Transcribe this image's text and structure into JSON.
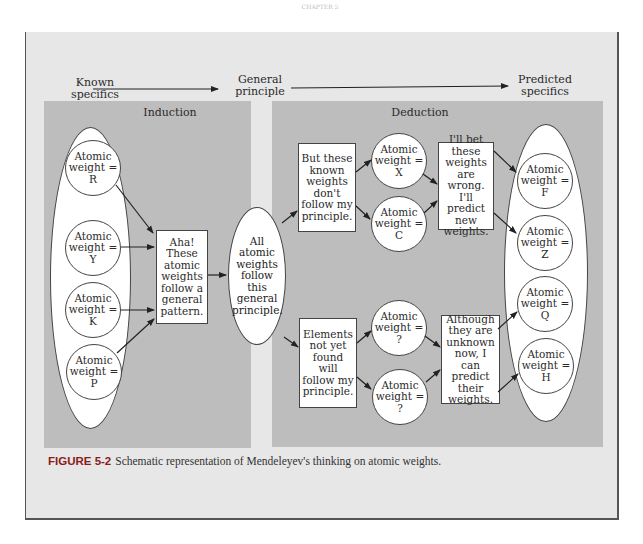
{
  "header": {
    "running_head": "CHAPTER 5"
  },
  "flow_labels": {
    "known_specifics": [
      "Known",
      "specifics"
    ],
    "general_principle": [
      "General",
      "principle"
    ],
    "predicted_specifics": [
      "Predicted",
      "specifics"
    ]
  },
  "panels": {
    "induction": {
      "title": "Induction"
    },
    "deduction": {
      "title": "Deduction"
    }
  },
  "induction": {
    "known_weights": [
      {
        "line1": "Atomic",
        "line2": "weight =",
        "value": "R"
      },
      {
        "line1": "Atomic",
        "line2": "weight =",
        "value": "Y"
      },
      {
        "line1": "Atomic",
        "line2": "weight =",
        "value": "K"
      },
      {
        "line1": "Atomic",
        "line2": "weight =",
        "value": "P"
      }
    ],
    "pattern_box": "Aha! These atomic weights follow a general pattern."
  },
  "principle": {
    "text": "All atomic weights follow this general principle."
  },
  "deduction": {
    "upper_box": "But these known weights don't follow my principle.",
    "upper_weights": [
      {
        "line1": "Atomic",
        "line2": "weight =",
        "value": "X"
      },
      {
        "line1": "Atomic",
        "line2": "weight =",
        "value": "C"
      }
    ],
    "upper_conclusion": "I'll bet these weights are wrong. I'll predict new weights.",
    "lower_box": "Elements not yet found will follow my principle.",
    "lower_weights": [
      {
        "line1": "Atomic",
        "line2": "weight =",
        "value": "?"
      },
      {
        "line1": "Atomic",
        "line2": "weight =",
        "value": "?"
      }
    ],
    "lower_conclusion": "Although they are unknown now, I can predict their weights.",
    "predicted_weights": [
      {
        "line1": "Atomic",
        "line2": "weight =",
        "value": "F"
      },
      {
        "line1": "Atomic",
        "line2": "weight =",
        "value": "Z"
      },
      {
        "line1": "Atomic",
        "line2": "weight =",
        "value": "Q"
      },
      {
        "line1": "Atomic",
        "line2": "weight =",
        "value": "H"
      }
    ]
  },
  "caption": {
    "label": "FIGURE 5-2",
    "text": "Schematic representation of Mendeleyev's thinking on atomic weights."
  },
  "colors": {
    "figure_background": "#e7e7e7",
    "panel_background": "#bdbdbd",
    "caption_label": "#8a1c1c"
  }
}
